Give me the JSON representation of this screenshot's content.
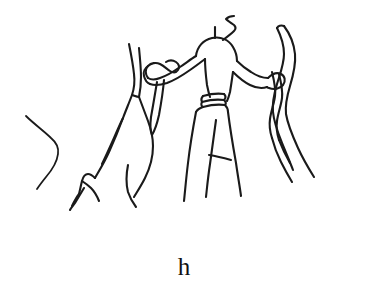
{
  "figure": {
    "caption_label": "h",
    "background_color": "#ffffff",
    "ink_color": "#1a1a1a",
    "canvas": {
      "width": 368,
      "height": 297
    },
    "elements": [
      {
        "name": "stray-arc-left",
        "description": "Isolated bent line at far left, angling down-right then down-left"
      },
      {
        "name": "animal-figure-left",
        "description": "Quadruped / antelope-like form with raised pointed head at left of centre"
      },
      {
        "name": "central-human-figure",
        "description": "Standing human figure with rounded head, topknot stub, outstretched arms, banded belt and A-shaped skirt or legs"
      },
      {
        "name": "serpent-form-right",
        "description": "Two tall sinuous wavy lines rising at right, grasped by the figure's right hand"
      },
      {
        "name": "staff-left",
        "description": "Pointed staff or blade held in the figure's left hand"
      }
    ]
  }
}
